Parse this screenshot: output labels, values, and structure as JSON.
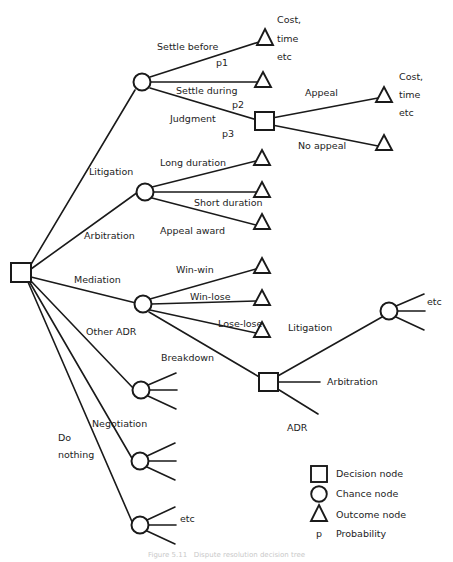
{
  "figure": {
    "type": "decision-tree",
    "caption": "Figure 5.11   Dispute resolution decision tree",
    "background": "#ffffff",
    "stroke": "#1a1a1a"
  },
  "nodes": [
    {
      "id": "root",
      "kind": "decision",
      "x": 22,
      "y": 272,
      "label": ""
    },
    {
      "id": "litigation-chance",
      "kind": "chance",
      "x": 142,
      "y": 82,
      "label": ""
    },
    {
      "id": "judgment-decision",
      "kind": "decision",
      "x": 264,
      "y": 121,
      "label": ""
    },
    {
      "id": "arbitration-chance",
      "kind": "chance",
      "x": 145,
      "y": 192,
      "label": ""
    },
    {
      "id": "mediation-chance",
      "kind": "chance",
      "x": 143,
      "y": 304,
      "label": ""
    },
    {
      "id": "breakdown-decision",
      "kind": "decision",
      "x": 268,
      "y": 382,
      "label": ""
    },
    {
      "id": "breakdown-litigation-chance",
      "kind": "chance",
      "x": 389,
      "y": 311,
      "label": ""
    },
    {
      "id": "other-adr-chance",
      "kind": "chance",
      "x": 141,
      "y": 390,
      "label": ""
    },
    {
      "id": "negotiation-chance",
      "kind": "chance",
      "x": 140,
      "y": 461,
      "label": ""
    },
    {
      "id": "donothing-chance",
      "kind": "chance",
      "x": 140,
      "y": 525,
      "label": ""
    }
  ],
  "outcomes": [
    {
      "id": "settle-before-outcome",
      "x": 265,
      "y": 38
    },
    {
      "id": "settle-during-outcome",
      "x": 263,
      "y": 80
    },
    {
      "id": "appeal-outcome",
      "x": 384,
      "y": 95
    },
    {
      "id": "no-appeal-outcome",
      "x": 384,
      "y": 143
    },
    {
      "id": "long-duration-outcome",
      "x": 262,
      "y": 158
    },
    {
      "id": "short-duration-outcome",
      "x": 262,
      "y": 190
    },
    {
      "id": "appeal-award-outcome",
      "x": 262,
      "y": 222
    },
    {
      "id": "win-win-outcome",
      "x": 262,
      "y": 266
    },
    {
      "id": "win-lose-outcome",
      "x": 262,
      "y": 298
    },
    {
      "id": "lose-lose-outcome",
      "x": 262,
      "y": 330
    }
  ],
  "branch_labels": {
    "settle_before": "Settle before",
    "settle_before_prob": "p1",
    "settle_during": "Settle during",
    "settle_during_prob": "p2",
    "judgment": "Judgment",
    "judgment_prob": "p3",
    "appeal": "Appeal",
    "no_appeal": "No appeal",
    "litigation": "Litigation",
    "long_duration": "Long duration",
    "short_duration": "Short duration",
    "appeal_award": "Appeal award",
    "arbitration": "Arbitration",
    "mediation": "Mediation",
    "win_win": "Win-win",
    "win_lose": "Win-lose",
    "lose_lose": "Lose-lose",
    "breakdown": "Breakdown",
    "other_adr": "Other ADR",
    "negotiation": "Negotiation",
    "do_nothing_line1": "Do",
    "do_nothing_line2": "nothing",
    "breakdown_litigation": "Litigation",
    "breakdown_arbitration": "Arbitration",
    "breakdown_adr": "ADR",
    "etc_right": "etc",
    "etc_bottom": "etc"
  },
  "outcome_labels": {
    "top_cost": "Cost,",
    "top_time": "time",
    "top_etc": "etc",
    "right_cost": "Cost,",
    "right_time": "time",
    "right_etc": "etc"
  },
  "legend": {
    "items": [
      {
        "symbol": "square",
        "icon_name": "decision-node-icon",
        "label": "Decision node"
      },
      {
        "symbol": "circle",
        "icon_name": "chance-node-icon",
        "label": "Chance node"
      },
      {
        "symbol": "triangle",
        "icon_name": "outcome-node-icon",
        "label": "Outcome node"
      },
      {
        "symbol": "p",
        "icon_name": "probability-symbol",
        "label": "Probability"
      }
    ]
  }
}
